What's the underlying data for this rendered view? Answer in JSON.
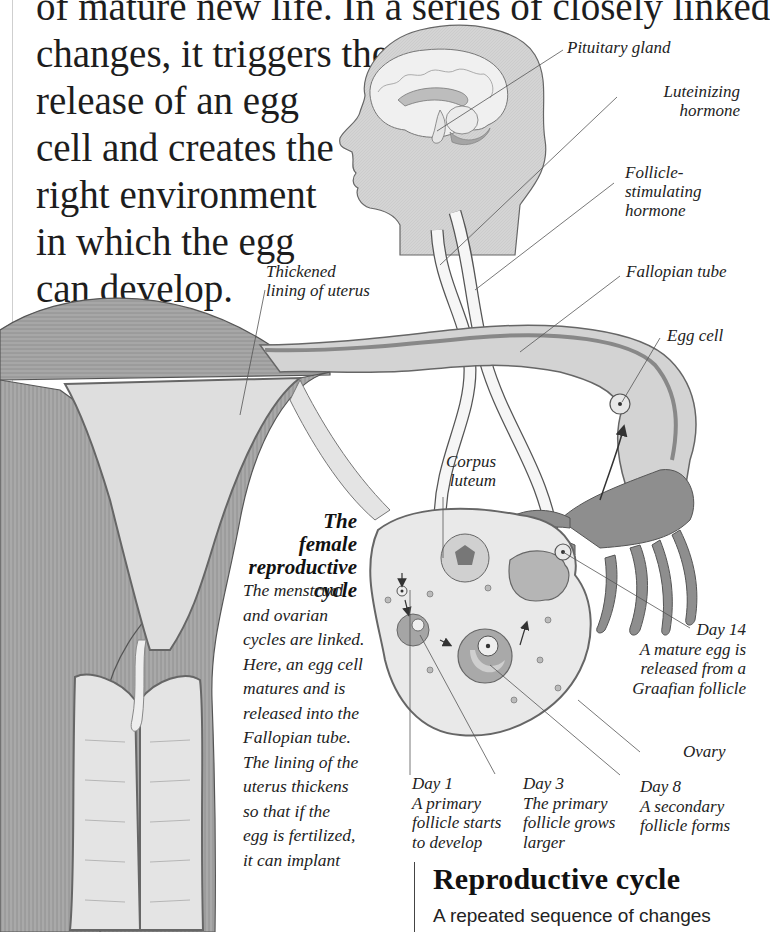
{
  "intro": {
    "lines": [
      "of mature new life. In a series of closely linked",
      "changes, it triggers the",
      "release of an egg",
      "cell and creates the",
      "right environment",
      "in which the egg",
      "can develop."
    ]
  },
  "labels": {
    "pituitary_gland": "Pituitary gland",
    "luteinizing_hormone": [
      "Luteinizing",
      "hormone"
    ],
    "follicle_stimulating_hormone": [
      "Follicle-",
      "stimulating",
      "hormone"
    ],
    "thickened_lining": [
      "Thickened",
      "lining of uterus"
    ],
    "fallopian_tube": "Fallopian tube",
    "egg_cell": "Egg cell",
    "corpus_luteum": [
      "Corpus",
      "luteum"
    ],
    "ovary": "Ovary"
  },
  "days": [
    {
      "day": "Day 1",
      "text": [
        "A primary",
        "follicle starts",
        "to develop"
      ]
    },
    {
      "day": "Day 3",
      "text": [
        "The primary",
        "follicle grows",
        "larger"
      ]
    },
    {
      "day": "Day 8",
      "text": [
        "A secondary",
        "follicle forms"
      ]
    },
    {
      "day": "Day 14",
      "text": [
        "A mature egg is",
        "released from a",
        "Graafian follicle"
      ]
    }
  ],
  "caption": {
    "title": [
      "The",
      "female",
      "reproductive",
      "cycle"
    ],
    "body": [
      "The menstrual",
      "and ovarian",
      "cycles are linked.",
      "Here, an egg cell",
      "matures and is",
      "released into the",
      "Fallopian tube.",
      "The lining of the",
      "uterus thickens",
      "so that if the",
      "egg is fertilized,",
      "it can implant"
    ]
  },
  "section": {
    "title": "Reproductive cycle",
    "body": "A repeated sequence of changes"
  },
  "colors": {
    "tissue_dark": "#8f8f8f",
    "tissue_mid": "#b5b5b5",
    "tissue_light": "#dcdcdc",
    "head_fill": "#d2d2d2",
    "outline": "#555555",
    "text": "#1d1d1d"
  }
}
